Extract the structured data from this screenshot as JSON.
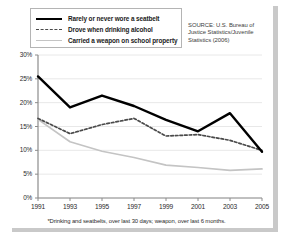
{
  "source_note": "SOURCE: U.S. Bureau of Justice Statistics/Juvenile Statistics (2006)",
  "footnote": "*Drinking and seatbelts, over last 30 days; weapon, over last 6 months.",
  "colors": {
    "seatbelt_line": "#000000",
    "alcohol_line": "#4a4a4a",
    "weapon_line": "#c4c4c4",
    "grid": "#e8e8e8",
    "axis": "#8c8c8c",
    "card_background": "#ffffff",
    "plate_shadow": "#c9c9c9"
  },
  "chart_data": {
    "type": "line",
    "title": "",
    "subtitle": "",
    "xlabel": "",
    "ylabel": "",
    "x": [
      1991,
      1993,
      1995,
      1997,
      1999,
      2001,
      2003,
      2005
    ],
    "xtick_labels": [
      "1991",
      "1993",
      "1995",
      "1997",
      "1999",
      "2001",
      "2003",
      "2005"
    ],
    "ytick_labels": [
      "0%",
      "5%",
      "10%",
      "15%",
      "20%",
      "25%",
      "30%"
    ],
    "yticks": [
      0,
      5,
      10,
      15,
      20,
      25,
      30
    ],
    "ylim": [
      0,
      30
    ],
    "xlim": [
      1991,
      2005
    ],
    "grid": true,
    "legend_position": "top-left",
    "series": [
      {
        "name": "Rarely or never wore a seatbelt",
        "style": "solid",
        "color": "#000000",
        "values": [
          25.5,
          19.0,
          21.5,
          19.3,
          16.4,
          14.0,
          17.8,
          9.7
        ]
      },
      {
        "name": "Drove when drinking alcohol",
        "style": "dashed",
        "color": "#4a4a4a",
        "values": [
          16.7,
          13.5,
          15.4,
          16.7,
          13.0,
          13.3,
          12.1,
          10.0
        ]
      },
      {
        "name": "Carried a weapon on school property",
        "style": "solid-light",
        "color": "#c4c4c4",
        "values": [
          16.5,
          11.8,
          9.8,
          8.5,
          6.9,
          6.4,
          5.8,
          6.1
        ]
      }
    ]
  }
}
